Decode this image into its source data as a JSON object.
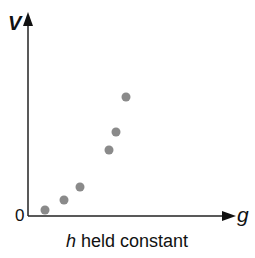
{
  "chart_data": {
    "type": "scatter",
    "title": "",
    "xlabel": "g",
    "ylabel": "V",
    "origin_label": "0",
    "caption_var": "h",
    "caption_rest": " held constant",
    "grid": false,
    "point_color": "#8a8a8a",
    "points": [
      {
        "x": 45,
        "y": 210
      },
      {
        "x": 64,
        "y": 200
      },
      {
        "x": 80,
        "y": 187
      },
      {
        "x": 109,
        "y": 150
      },
      {
        "x": 116,
        "y": 132
      },
      {
        "x": 126,
        "y": 97
      }
    ]
  }
}
